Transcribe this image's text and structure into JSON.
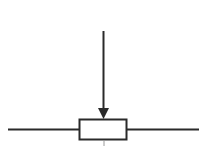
{
  "diagram": {
    "type": "potentiometer-schematic-symbol",
    "components": [
      {
        "name": "resistor-body",
        "shape": "rectangle"
      },
      {
        "name": "wiper-arrow",
        "shape": "arrow",
        "direction": "down"
      },
      {
        "name": "left-lead",
        "shape": "line"
      },
      {
        "name": "right-lead",
        "shape": "line"
      }
    ],
    "colors": {
      "stroke": "#2a2a2a",
      "background": "#ffffff",
      "fill": "#ffffff"
    }
  }
}
